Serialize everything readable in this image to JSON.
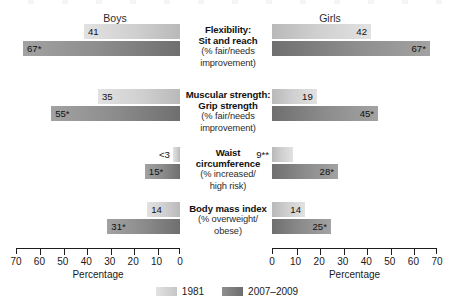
{
  "headers": {
    "left_panel": "Boys",
    "right_panel": "Girls"
  },
  "axis": {
    "title": "Percentage",
    "left_ticks": [
      "70",
      "60",
      "50",
      "40",
      "30",
      "20",
      "10",
      "0"
    ],
    "right_ticks": [
      "0",
      "10",
      "20",
      "30",
      "40",
      "50",
      "60",
      "70"
    ],
    "max": 70,
    "tick_step": 10
  },
  "legend": {
    "items": [
      {
        "label": "1981",
        "key": "s1981"
      },
      {
        "label": "2007–2009",
        "key": "s2007"
      }
    ]
  },
  "rows": [
    {
      "title_line1": "Flexibility:",
      "title_line2": "Sit and reach",
      "sub_line1": "(% fair/needs",
      "sub_line2": "improvement)",
      "boys_1981_label": "41",
      "boys_2007_label": "67*",
      "girls_1981_label": "42",
      "girls_2007_label": "67*"
    },
    {
      "title_line1": "Muscular strength:",
      "title_line2": "Grip strength",
      "sub_line1": "(% fair/needs",
      "sub_line2": "improvement)",
      "boys_1981_label": "35",
      "boys_2007_label": "55*",
      "girls_1981_label": "19",
      "girls_2007_label": "45*"
    },
    {
      "title_line1": "Waist",
      "title_line2": "circumference",
      "sub_line1": "(% increased/",
      "sub_line2": "high risk)",
      "boys_1981_label": "<3",
      "boys_2007_label": "15*",
      "girls_1981_label": "9**",
      "girls_2007_label": "28*"
    },
    {
      "title_line1": "Body mass index",
      "title_line2": "",
      "sub_line1": "(% overweight/",
      "sub_line2": "obese)",
      "boys_1981_label": "14",
      "boys_2007_label": "31*",
      "girls_1981_label": "14",
      "girls_2007_label": "25*"
    }
  ],
  "chart_data": {
    "type": "bar",
    "title": "",
    "orientation": "horizontal",
    "layout": "back-to-back paired panels (Boys mirrored left, Girls right)",
    "xlabel": "Percentage",
    "ylabel": "",
    "xlim": [
      0,
      70
    ],
    "grid": false,
    "legend_position": "bottom-center",
    "categories": [
      "Flexibility: Sit and reach (% fair/needs improvement)",
      "Muscular strength: Grip strength (% fair/needs improvement)",
      "Waist circumference (% increased/high risk)",
      "Body mass index (% overweight/obese)"
    ],
    "panels": [
      {
        "name": "Boys",
        "axis_direction": "reversed",
        "series": [
          {
            "name": "1981",
            "values": [
              41,
              35,
              3,
              14
            ],
            "labels": [
              "41",
              "35",
              "<3",
              "14"
            ]
          },
          {
            "name": "2007–2009",
            "values": [
              67,
              55,
              15,
              31
            ],
            "labels": [
              "67*",
              "55*",
              "15*",
              "31*"
            ]
          }
        ]
      },
      {
        "name": "Girls",
        "axis_direction": "normal",
        "series": [
          {
            "name": "1981",
            "values": [
              42,
              19,
              9,
              14
            ],
            "labels": [
              "42",
              "19",
              "9**",
              "14"
            ]
          },
          {
            "name": "2007–2009",
            "values": [
              67,
              45,
              28,
              25
            ],
            "labels": [
              "67*",
              "45*",
              "28*",
              "25*"
            ]
          }
        ]
      }
    ],
    "annotations": [
      "* denotes statistically significant difference",
      "** denotes value with higher variability",
      "<3 denotes value less than 3 percent"
    ]
  }
}
